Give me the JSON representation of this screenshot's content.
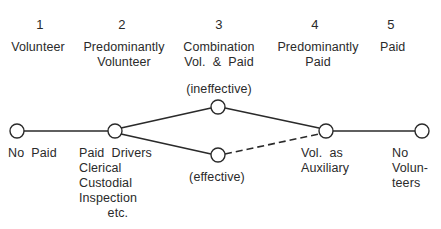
{
  "stages": [
    {
      "number": "1",
      "label": "Volunteer"
    },
    {
      "number": "2",
      "label": "Predominantly\nVolunteer"
    },
    {
      "number": "3",
      "label": "Combination\nVol.  &  Paid"
    },
    {
      "number": "4",
      "label": "Predominantly\nPaid"
    },
    {
      "number": "5",
      "label": "Paid"
    }
  ],
  "branches": {
    "upper": "(ineffective)",
    "lower": "(effective)"
  },
  "nodes": [
    {
      "id": "A",
      "caption": "No  Paid"
    },
    {
      "id": "B",
      "caption": "Paid  Drivers\nClerical\nCustodial\nInspection\n        etc."
    },
    {
      "id": "C",
      "caption": ""
    },
    {
      "id": "D",
      "caption": ""
    },
    {
      "id": "E",
      "caption": "Vol.  as\nAuxiliary"
    },
    {
      "id": "F",
      "caption": "No\nVolun-\nteers"
    }
  ],
  "edges": [
    {
      "from": "A",
      "to": "B",
      "style": "solid"
    },
    {
      "from": "B",
      "to": "C",
      "style": "solid"
    },
    {
      "from": "B",
      "to": "D",
      "style": "solid"
    },
    {
      "from": "C",
      "to": "E",
      "style": "solid"
    },
    {
      "from": "D",
      "to": "E",
      "style": "dashed"
    },
    {
      "from": "E",
      "to": "F",
      "style": "solid"
    }
  ],
  "colors": {
    "ink": "#2a2a2a",
    "background": "#ffffff"
  }
}
